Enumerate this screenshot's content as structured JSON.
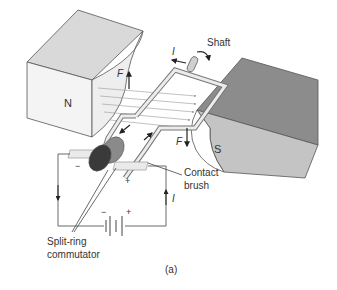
{
  "labels": {
    "north_pole": "N",
    "south_pole": "S",
    "shaft": "Shaft",
    "current_top": "I",
    "current_right": "I",
    "force_left": "F",
    "force_right": "F",
    "contact_brush_line1": "Contact",
    "contact_brush_line2": "brush",
    "commutator_line1": "Split-ring",
    "commutator_line2": "commutator",
    "battery_minus": "−",
    "battery_plus": "+",
    "brush_minus": "−",
    "brush_plus": "+",
    "caption": "(a)"
  },
  "colors": {
    "north_magnet_top": "#d9d9d9",
    "north_magnet_front": "#f4f4f4",
    "south_magnet_top": "#8c8c8c",
    "south_magnet_front": "#c4c4c4",
    "coil": "#e8e8e8",
    "commutator_dark": "#3a3a3a",
    "commutator_light": "#8a8a8a",
    "line": "#444444"
  }
}
